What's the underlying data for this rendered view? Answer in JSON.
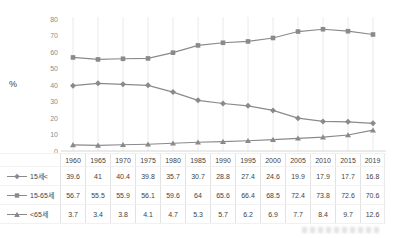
{
  "ylabel": "%",
  "colors": {
    "line": "#8a8a8a",
    "grid": "#eaeaea",
    "axis": "#d6d6d6",
    "tick_text": "#8c8c8c",
    "table_text": "#3f3f3f",
    "table_border": "#e2e2e2"
  },
  "chart_data": {
    "type": "line",
    "title": "",
    "xlabel": "",
    "ylabel": "%",
    "ylim": [
      0,
      80
    ],
    "yticks": [
      0,
      10,
      20,
      30,
      40,
      50,
      60,
      70,
      80
    ],
    "grid": "vertical-only",
    "legend_position": "table-rows-left",
    "x": [
      1960,
      1965,
      1970,
      1975,
      1980,
      1985,
      1990,
      1995,
      2000,
      2005,
      2010,
      2015,
      2019
    ],
    "series": [
      {
        "id": "under-15",
        "name": "15세<",
        "marker": "diamond",
        "values": [
          39.6,
          41,
          40.4,
          39.8,
          35.7,
          30.7,
          28.8,
          27.4,
          24.6,
          19.9,
          17.9,
          17.7,
          16.8
        ]
      },
      {
        "id": "15-to-65",
        "name": "15-65세",
        "marker": "square",
        "values": [
          56.7,
          55.5,
          55.9,
          56.1,
          59.6,
          64,
          65.6,
          66.4,
          68.5,
          72.4,
          73.8,
          72.6,
          70.6
        ]
      },
      {
        "id": "over-65",
        "name": "<65세",
        "marker": "triangle",
        "values": [
          3.7,
          3.4,
          3.8,
          4.1,
          4.7,
          5.3,
          5.7,
          6.2,
          6.9,
          7.7,
          8.4,
          9.7,
          12.6
        ]
      }
    ]
  }
}
